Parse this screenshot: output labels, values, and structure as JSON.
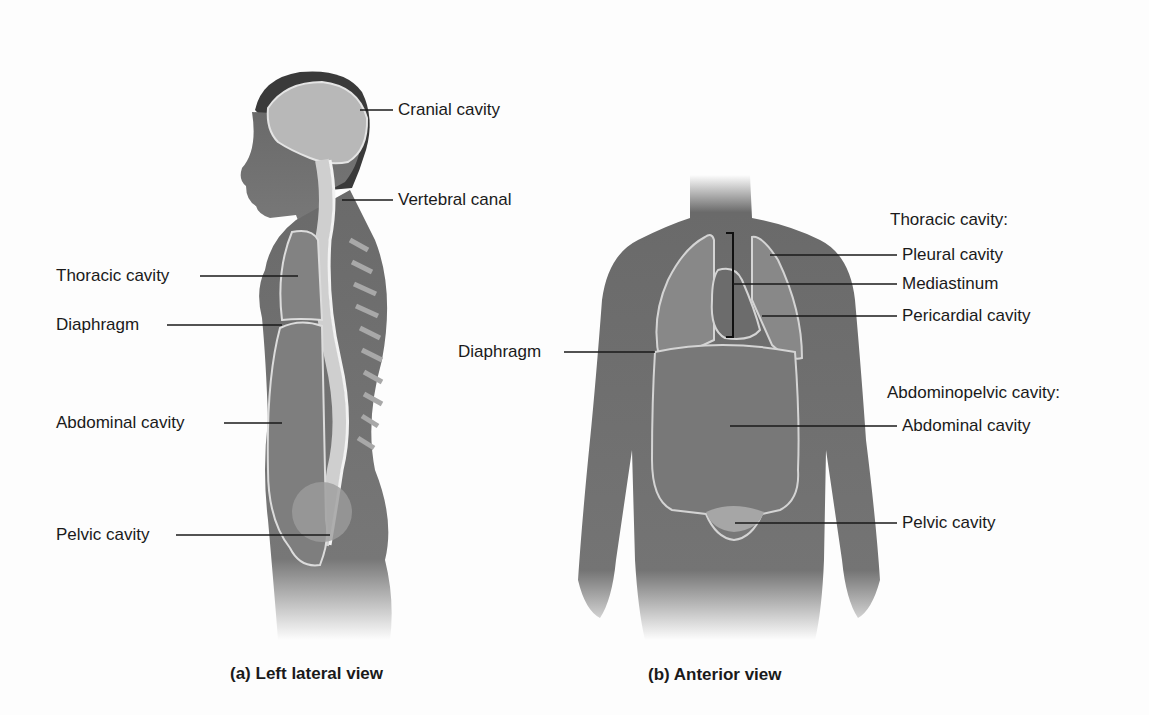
{
  "figure_a": {
    "caption": "(a) Left lateral view",
    "labels": {
      "cranial": "Cranial cavity",
      "vertebral": "Vertebral canal",
      "thoracic": "Thoracic cavity",
      "diaphragm": "Diaphragm",
      "abdominal": "Abdominal cavity",
      "pelvic": "Pelvic cavity"
    }
  },
  "figure_b": {
    "caption": "(b) Anterior view",
    "labels": {
      "thoracic_header": "Thoracic cavity:",
      "pleural": "Pleural cavity",
      "mediastinum": "Mediastinum",
      "pericardial": "Pericardial cavity",
      "diaphragm": "Diaphragm",
      "abdominopelvic_header": "Abdominopelvic cavity:",
      "abdominal": "Abdominal cavity",
      "pelvic": "Pelvic cavity"
    }
  },
  "colors": {
    "skin": "#6f6f6f",
    "cavity": "#8a8a8a",
    "outline": "#d8d8d8",
    "text": "#1a1a1a"
  }
}
